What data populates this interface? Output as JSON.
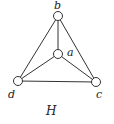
{
  "diagram": {
    "caption": "H",
    "nodes": [
      {
        "id": "b",
        "label": "b",
        "x": 58,
        "y": 16
      },
      {
        "id": "a",
        "label": "a",
        "x": 58,
        "y": 54
      },
      {
        "id": "d",
        "label": "d",
        "x": 18,
        "y": 81
      },
      {
        "id": "c",
        "label": "c",
        "x": 96,
        "y": 82
      }
    ],
    "edges": [
      [
        "b",
        "a"
      ],
      [
        "b",
        "d"
      ],
      [
        "b",
        "c"
      ],
      [
        "a",
        "d"
      ],
      [
        "a",
        "c"
      ],
      [
        "d",
        "c"
      ]
    ]
  }
}
